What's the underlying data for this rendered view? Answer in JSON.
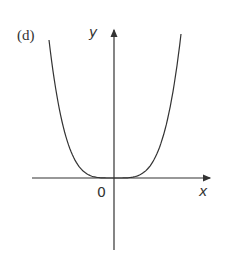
{
  "chart_data": {
    "type": "line",
    "title": "(d)",
    "xlabel": "x",
    "ylabel": "y",
    "origin_label": "0",
    "function": "y = x^4 (even-power curve, flat minimum at origin)",
    "series": [
      {
        "name": "curve",
        "x": [
          -1.0,
          -0.8,
          -0.6,
          -0.4,
          -0.2,
          0,
          0.2,
          0.4,
          0.6,
          0.8,
          1.0
        ],
        "y": [
          1.0,
          0.41,
          0.13,
          0.026,
          0.0016,
          0,
          0.0016,
          0.026,
          0.13,
          0.41,
          1.0
        ]
      }
    ],
    "grid": false,
    "legend": "none",
    "axes": "arrowed, crossing at origin"
  },
  "labels": {
    "panel": "(d)",
    "y_axis": "y",
    "x_axis": "x",
    "origin": "0"
  },
  "colors": {
    "line": "#333333",
    "background": "#ffffff"
  }
}
